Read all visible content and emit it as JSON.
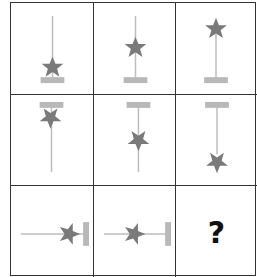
{
  "puzzle": {
    "type": "3x3 visual pattern matrix",
    "colors": {
      "grid_line": "#333333",
      "stick": "#bdbdbd",
      "bar": "#b8b8b8",
      "star": "#7a7a7a",
      "question_mark": "#111111"
    },
    "cells": [
      {
        "row": 1,
        "col": 1,
        "orientation": "vertical",
        "bar_position": "bottom",
        "star_position": "near-bar"
      },
      {
        "row": 1,
        "col": 2,
        "orientation": "vertical",
        "bar_position": "bottom",
        "star_position": "middle"
      },
      {
        "row": 1,
        "col": 3,
        "orientation": "vertical",
        "bar_position": "bottom",
        "star_position": "far-end"
      },
      {
        "row": 2,
        "col": 1,
        "orientation": "vertical",
        "bar_position": "top",
        "star_position": "near-bar"
      },
      {
        "row": 2,
        "col": 2,
        "orientation": "vertical",
        "bar_position": "top",
        "star_position": "middle"
      },
      {
        "row": 2,
        "col": 3,
        "orientation": "vertical",
        "bar_position": "top",
        "star_position": "far-end"
      },
      {
        "row": 3,
        "col": 1,
        "orientation": "horizontal",
        "bar_position": "right",
        "star_position": "near-bar"
      },
      {
        "row": 3,
        "col": 2,
        "orientation": "horizontal",
        "bar_position": "right",
        "star_position": "middle"
      },
      {
        "row": 3,
        "col": 3,
        "answer_placeholder": "?"
      }
    ]
  }
}
